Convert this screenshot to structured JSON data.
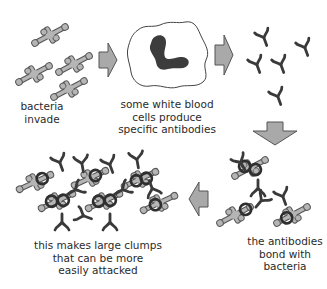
{
  "diagram": {
    "type": "process-flow",
    "colors": {
      "arrow_fill": "#a9a9a9",
      "arrow_stroke": "#555555",
      "bacteria_fill": "#b5b5b5",
      "bacteria_stroke": "#555555",
      "antibody": "#3a3a3a",
      "nucleus": "#3c3c3c",
      "text": "#2a2a2a"
    },
    "steps": [
      {
        "id": "bacteria",
        "label": "bacteria\ninvade"
      },
      {
        "id": "white-blood-cell",
        "label": "some white blood\ncells produce\nspecific antibodies"
      },
      {
        "id": "antibodies",
        "label": ""
      },
      {
        "id": "bonded",
        "label": "the antibodies\nbond with\nbacteria"
      },
      {
        "id": "clumps",
        "label": "this makes large clumps\nthat can be more\neasily attacked"
      }
    ],
    "arrows": [
      {
        "from": "bacteria",
        "to": "white-blood-cell",
        "direction": "right"
      },
      {
        "from": "white-blood-cell",
        "to": "antibodies",
        "direction": "right"
      },
      {
        "from": "antibodies",
        "to": "bonded",
        "direction": "down"
      },
      {
        "from": "bonded",
        "to": "clumps",
        "direction": "left"
      }
    ]
  }
}
